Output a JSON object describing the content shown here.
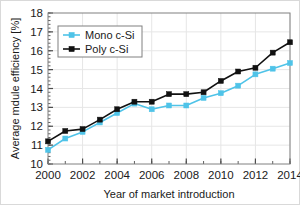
{
  "chart_data": {
    "type": "line",
    "title": "",
    "xlabel": "Year of market introduction",
    "ylabel": "Average mdule efficiency [%]",
    "x": [
      2000,
      2001,
      2002,
      2003,
      2004,
      2005,
      2006,
      2007,
      2008,
      2009,
      2010,
      2011,
      2012,
      2013,
      2014
    ],
    "xlim": [
      2000,
      2014
    ],
    "ylim": [
      10,
      18
    ],
    "xticks": [
      2000,
      2002,
      2004,
      2006,
      2008,
      2010,
      2012,
      2014
    ],
    "xtick_labels": [
      "2000",
      "2002",
      "2004",
      "2006",
      "2008",
      "2010",
      "2012",
      "2014"
    ],
    "x_minor_tick_step": 1,
    "yticks": [
      10,
      11,
      12,
      13,
      14,
      15,
      16,
      17,
      18
    ],
    "ytick_labels": [
      "10",
      "11",
      "12",
      "13",
      "14",
      "15",
      "16",
      "17",
      "18"
    ],
    "y_minor_tick_step": 0.2,
    "grid": "both",
    "legend_position": "upper left",
    "series": [
      {
        "name": "Mono c-Si",
        "color": "#4FC3E8",
        "marker": "square",
        "values": [
          10.75,
          11.35,
          11.7,
          12.2,
          12.7,
          13.2,
          12.9,
          13.1,
          13.1,
          13.5,
          13.75,
          14.15,
          14.75,
          15.05,
          15.35
        ]
      },
      {
        "name": "Poly c-Si",
        "color": "#111111",
        "marker": "square",
        "values": [
          11.2,
          11.75,
          11.85,
          12.35,
          12.9,
          13.3,
          13.3,
          13.7,
          13.7,
          13.8,
          14.4,
          14.9,
          15.1,
          15.9,
          16.45
        ]
      }
    ]
  },
  "legend": {
    "entries": [
      {
        "label": "Mono c-Si"
      },
      {
        "label": "Poly c-Si"
      }
    ]
  },
  "colors": {
    "mono": "#4FC3E8",
    "poly": "#111111",
    "axis": "#4d4d4d",
    "grid": "#e6e6e6",
    "frame": "#808080"
  }
}
